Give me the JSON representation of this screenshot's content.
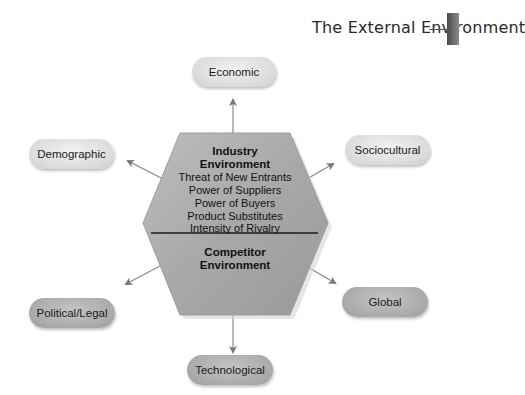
{
  "header": {
    "title": "The External Environment"
  },
  "hexagon": {
    "industry": {
      "title_line1": "Industry",
      "title_line2": "Environment",
      "items": [
        "Threat of New Entrants",
        "Power of Suppliers",
        "Power of Buyers",
        "Product Substitutes",
        "Intensity of Rivalry"
      ]
    },
    "competitor": {
      "title_line1": "Competitor",
      "title_line2": "Environment"
    }
  },
  "segments": {
    "economic": "Economic",
    "sociocultural": "Sociocultural",
    "global": "Global",
    "technological": "Technological",
    "political_legal": "Political/Legal",
    "demographic": "Demographic"
  },
  "colors": {
    "hexagon_fill": "#a9a9a9",
    "pill_light": "#dcdcdc",
    "pill_dark": "#aaaaaa",
    "arrow": "#777777"
  }
}
